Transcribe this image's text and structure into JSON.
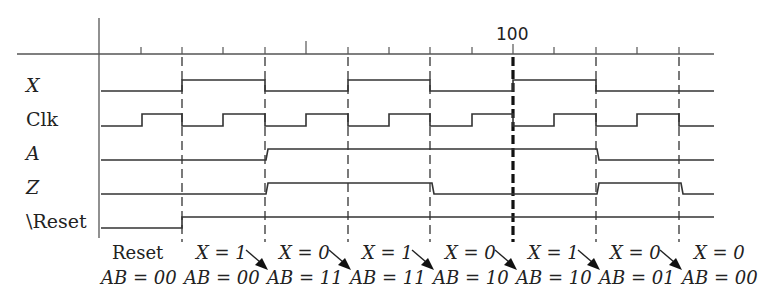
{
  "diagram": {
    "type": "timing-diagram",
    "axis": {
      "marker_label": "100",
      "tick_spacing_px": 41.4,
      "origin_x": 99,
      "ticks_x": [
        141,
        182,
        223,
        265,
        306,
        348,
        389,
        430,
        472,
        513,
        554,
        596,
        637,
        679
      ],
      "clock_edges_x": [
        182,
        265,
        348,
        430,
        513,
        596,
        679
      ],
      "highlighted_edge_x": 513
    },
    "signals": [
      {
        "name": "X",
        "italic": true,
        "levels": [
          0,
          1,
          0,
          1,
          0,
          1,
          0,
          0
        ]
      },
      {
        "name": "Clk",
        "italic": false,
        "levels": "square-wave"
      },
      {
        "name": "A",
        "italic": true,
        "levels": [
          0,
          0,
          1,
          1,
          1,
          1,
          0,
          0
        ]
      },
      {
        "name": "Z",
        "italic": true,
        "levels": [
          0,
          0,
          1,
          1,
          0,
          0,
          1,
          0
        ]
      },
      {
        "name": "\\Reset",
        "italic": false,
        "levels": [
          0,
          1,
          1,
          1,
          1,
          1,
          1,
          1
        ]
      }
    ],
    "states": [
      {
        "top": "Reset",
        "bottom": "AB = 00",
        "arrow": false
      },
      {
        "top": "X = 1",
        "bottom": "AB = 00",
        "arrow": true
      },
      {
        "top": "X = 0",
        "bottom": "AB = 11",
        "arrow": true
      },
      {
        "top": "X = 1",
        "bottom": "AB = 11",
        "arrow": true
      },
      {
        "top": "X = 0",
        "bottom": "AB = 10",
        "arrow": true
      },
      {
        "top": "X = 1",
        "bottom": "AB = 10",
        "arrow": true
      },
      {
        "top": "X = 0",
        "bottom": "AB = 01",
        "arrow": true
      },
      {
        "top": "X = 0",
        "bottom": "AB = 00",
        "arrow": false
      }
    ],
    "colors": {
      "line": "#333333",
      "background": "#ffffff"
    }
  }
}
